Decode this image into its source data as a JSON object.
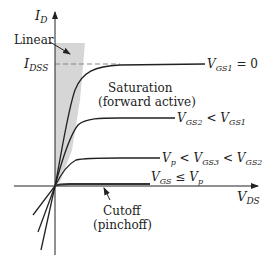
{
  "diagram": {
    "axes": {
      "y_label": "I",
      "y_sub": "D",
      "x_label": "V",
      "x_sub": "DS"
    },
    "idss": {
      "label": "I",
      "sub": "DSS"
    },
    "regions": {
      "linear": "Linear",
      "saturation_line1": "Saturation",
      "saturation_line2": "(forward active)",
      "cutoff_line1": "Cutoff",
      "cutoff_line2": "(pinchoff)"
    },
    "curves": [
      {
        "name": "VGS1",
        "label_parts": [
          "V",
          "GS1",
          " = 0"
        ]
      },
      {
        "name": "VGS2",
        "label_parts": [
          "V",
          "GS2",
          " < ",
          "V",
          "GS1"
        ]
      },
      {
        "name": "VGS3",
        "label_parts": [
          "V",
          "p",
          " < ",
          "V",
          "GS3",
          " < ",
          "V",
          "GS2"
        ]
      },
      {
        "name": "cutoff",
        "label_parts": [
          "V",
          "GS",
          " ≤ ",
          "V",
          "p"
        ]
      }
    ],
    "colors": {
      "line": "#222222",
      "shade": "#d4d4d4",
      "dash": "#888888"
    }
  }
}
